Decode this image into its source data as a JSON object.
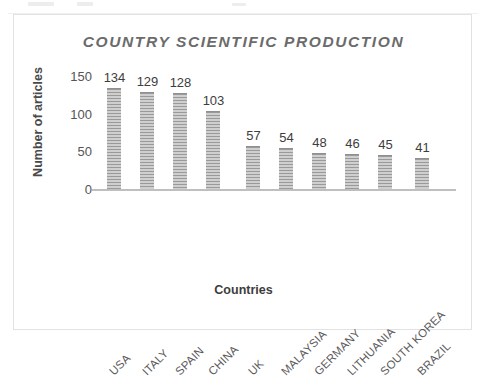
{
  "chart_data": {
    "type": "bar",
    "title": "COUNTRY SCIENTIFIC PRODUCTION",
    "xlabel": "Countries",
    "ylabel": "Number of articles",
    "categories": [
      "USA",
      "ITALY",
      "SPAIN",
      "CHINA",
      "UK",
      "MALAYSIA",
      "GERMANY",
      "LITHUANIA",
      "SOUTH KOREA",
      "BRAZIL"
    ],
    "values": [
      134,
      129,
      128,
      103,
      57,
      54,
      48,
      46,
      45,
      41
    ],
    "data_labels": [
      "134",
      "129",
      "128",
      "103",
      "57",
      "54",
      "48",
      "46",
      "45",
      "41"
    ],
    "ylim": [
      0,
      150
    ],
    "y_ticks": [
      0,
      50,
      100,
      150
    ],
    "y_tick_labels": [
      "0",
      "50",
      "100",
      "150"
    ],
    "grid": false,
    "legend": false,
    "bar_fill": "#b9b9b9",
    "bar_pattern": "horizontal-stripes",
    "axis_color": "#bfbfbf",
    "title_color": "#6b6b6b",
    "border_color": "#e2e2e2"
  }
}
